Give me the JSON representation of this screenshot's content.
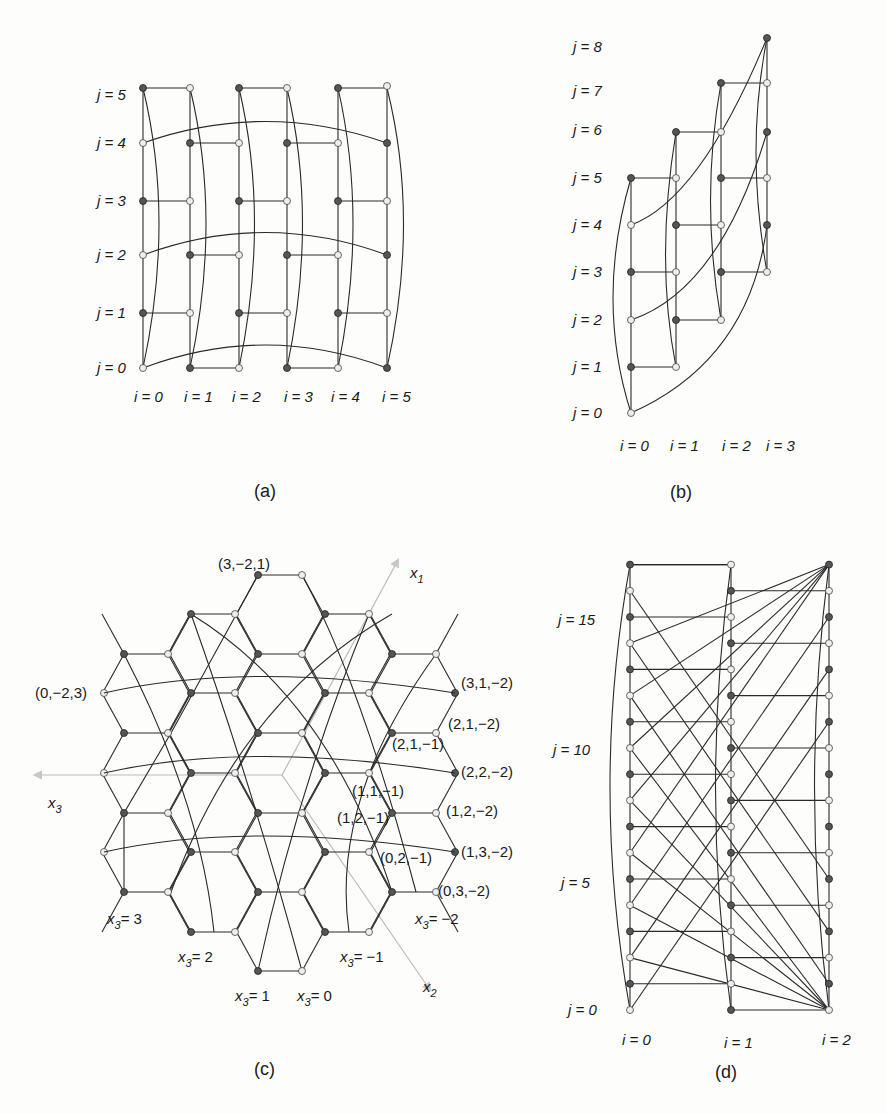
{
  "panels": {
    "a": {
      "caption": "(a)",
      "j_labels": [
        "j = 0",
        "j = 1",
        "j = 2",
        "j = 3",
        "j = 4",
        "j = 5"
      ],
      "i_labels": [
        "i = 0",
        "i = 1",
        "i = 2",
        "i = 3",
        "i = 4",
        "i = 5"
      ]
    },
    "b": {
      "caption": "(b)",
      "j_labels": [
        "j = 0",
        "j = 1",
        "j = 2",
        "j = 3",
        "j = 4",
        "j = 5",
        "j = 6",
        "j = 7",
        "j = 8"
      ],
      "i_labels": [
        "i = 0",
        "i = 1",
        "i = 2",
        "i = 3"
      ]
    },
    "c": {
      "caption": "(c)",
      "axes": {
        "x1": "x",
        "x1_sub": "1",
        "x2": "x",
        "x2_sub": "2",
        "x3": "x",
        "x3_sub": "3"
      },
      "coord_labels": [
        "(3,−2,1)",
        "(0,−2,3)",
        "(3,1,−2)",
        "(2,1,−2)",
        "(2,1,−1)",
        "(2,2,−2)",
        "(1,1,−1)",
        "(1,2,−2)",
        "(1,2,−1)",
        "(1,3,−2)",
        "(0,2,−1)",
        "(0,3,−2)"
      ],
      "x3_labels": [
        {
          "value": "= 3"
        },
        {
          "value": "= 2"
        },
        {
          "value": "= 1"
        },
        {
          "value": "= 0"
        },
        {
          "value": "= −1"
        },
        {
          "value": "= −2"
        }
      ]
    },
    "d": {
      "caption": "(d)",
      "j_labels": [
        "j = 0",
        "j = 5",
        "j = 10",
        "j = 15"
      ],
      "i_labels": [
        "i = 0",
        "i = 1",
        "i = 2"
      ]
    }
  }
}
